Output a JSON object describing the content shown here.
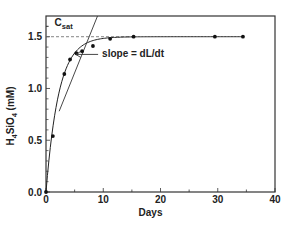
{
  "chart_data": {
    "type": "scatter",
    "title": "",
    "xlabel": "Days",
    "ylabel": "H4SiO4 (mM)",
    "ylabel_parts": {
      "pre": "H",
      "sub1": "4",
      "mid": "SiO",
      "sub2": "4",
      "post": " (mM)"
    },
    "xlim": [
      0,
      40
    ],
    "ylim": [
      0,
      1.7
    ],
    "xticks": [
      0,
      10,
      20,
      30,
      40
    ],
    "xtick_labels": [
      "0",
      "10",
      "20",
      "30",
      "40"
    ],
    "yticks": [
      0.0,
      0.5,
      1.0,
      1.5
    ],
    "ytick_labels": [
      "0.0",
      "0.5",
      "1.0",
      "1.5"
    ],
    "grid": false,
    "legend": null,
    "series": [
      {
        "name": "measured",
        "style": "points",
        "x": [
          0,
          1.2,
          3.2,
          4.2,
          5.3,
          6.3,
          8.2,
          11.2,
          15.3,
          29.5,
          34.4
        ],
        "y": [
          0.0,
          0.54,
          1.14,
          1.28,
          1.34,
          1.36,
          1.41,
          1.48,
          1.5,
          1.5,
          1.5
        ]
      },
      {
        "name": "fitted curve",
        "style": "line",
        "model": "C = Csat * (1 - exp(-k t))",
        "params": {
          "Csat": 1.5,
          "k": 0.45
        }
      },
      {
        "name": "tangent",
        "style": "line",
        "x": [
          2.3,
          9.0
        ],
        "y": [
          0.78,
          1.7
        ]
      }
    ],
    "reference_lines": [
      {
        "type": "horizontal",
        "y": 1.5,
        "style": "dashed",
        "label": "Csat"
      }
    ],
    "annotations": [
      {
        "text_main": "C",
        "text_sub": "sat",
        "x": 1.5,
        "y": 1.6
      },
      {
        "text": "slope = dL/dt",
        "x": 9.8,
        "y": 1.3,
        "arrow_to": [
          5.2,
          1.3
        ]
      }
    ]
  }
}
